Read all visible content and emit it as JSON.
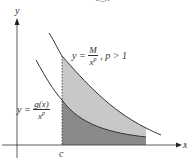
{
  "top_fragment": "b_n",
  "axes": {
    "x_label": "x",
    "y_label": "y",
    "c_label": "c"
  },
  "upper_curve": {
    "lhs": "y =",
    "num": "M",
    "den": "x",
    "den_exp": "p",
    "condition": ", p > 1"
  },
  "lower_curve": {
    "lhs": "y =",
    "num": "g(x)",
    "den": "x",
    "den_exp": "p"
  },
  "colors": {
    "upper_region": "#c8c8c8",
    "lower_region": "#8a8a8a",
    "curve": "#333333",
    "axis": "#333333"
  }
}
